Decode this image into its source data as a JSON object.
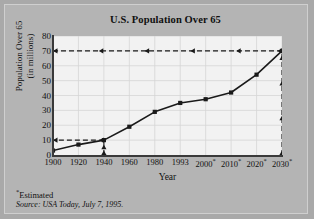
{
  "chart_data": {
    "type": "line",
    "title": "U.S. Population Over 65",
    "xlabel": "Year",
    "ylabel_line1": "Population Over 65",
    "ylabel_line2": "(in millions)",
    "categories": [
      "1900",
      "1920",
      "1940",
      "1960",
      "1980",
      "1993",
      "2000*",
      "2010*",
      "2020*",
      "2030*"
    ],
    "x": [
      1900,
      1920,
      1940,
      1960,
      1980,
      1993,
      2000,
      2010,
      2020,
      2030
    ],
    "values": [
      3,
      7,
      10,
      19,
      29,
      35,
      37.5,
      42,
      54,
      70
    ],
    "xtick_labels": [
      "1900",
      "1920",
      "1940",
      "1960",
      "1980",
      "1993",
      "2000",
      "2010",
      "2020",
      "2030"
    ],
    "xtick_estimated": [
      false,
      false,
      false,
      false,
      false,
      false,
      true,
      true,
      true,
      true
    ],
    "ytick_labels": [
      "0",
      "10",
      "20",
      "30",
      "40",
      "50",
      "60",
      "70",
      "80"
    ],
    "ytick_values": [
      0,
      10,
      20,
      30,
      40,
      50,
      60,
      70,
      80
    ],
    "ylim": [
      0,
      80
    ],
    "xlim": [
      1900,
      2030
    ],
    "grid": true,
    "legend": "none",
    "annotations": [
      {
        "name": "guide-70",
        "type": "dashed-horizontal-arrow",
        "y": 70,
        "from_x": 2030,
        "to_x": 1900,
        "label": "70"
      },
      {
        "name": "guide-10",
        "type": "dashed-horizontal-arrow",
        "y": 10,
        "from_x": 1940,
        "to_x": 1900,
        "label": "10"
      },
      {
        "name": "guide-1940",
        "type": "dashed-vertical-arrow",
        "x": 1940,
        "from_y": 0,
        "to_y": 10,
        "label": "1940"
      },
      {
        "name": "guide-2030",
        "type": "dashed-vertical-arrow",
        "x": 2030,
        "from_y": 0,
        "to_y": 70,
        "label": "2030"
      }
    ],
    "series_color": "#1a1a1a",
    "grid_color": "#d6d6d6",
    "plot_background": "#f2f2f2",
    "page_background": "#b4b4b4"
  },
  "footnotes": {
    "estimated": "Estimated",
    "estimated_marker": "*",
    "source_prefix": "Source:",
    "source_publication": "USA Today",
    "source_date": ", July 7, 1995."
  }
}
